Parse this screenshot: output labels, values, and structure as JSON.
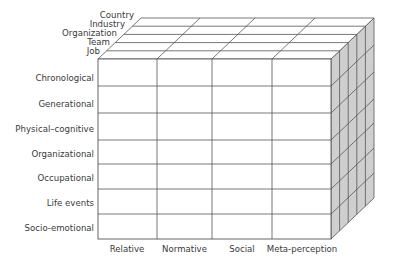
{
  "diagram": {
    "type": "3d-cube-matrix",
    "colors": {
      "front_face": "#ffffff",
      "top_face": "#ffffff",
      "side_face": "#cfcfcf",
      "grid_line": "#555555",
      "text": "#3a3a3a"
    },
    "front_rows": [
      {
        "label": "Chronological"
      },
      {
        "label": "Generational"
      },
      {
        "label": "Physical–cognitive"
      },
      {
        "label": "Organizational"
      },
      {
        "label": "Occupational"
      },
      {
        "label": "Life events"
      },
      {
        "label": "Socio-emotional"
      }
    ],
    "front_columns": [
      {
        "label": "Relative"
      },
      {
        "label": "Normative"
      },
      {
        "label": "Social"
      },
      {
        "label": "Meta-perception"
      }
    ],
    "depth_layers": [
      {
        "label": "Job"
      },
      {
        "label": "Team"
      },
      {
        "label": "Organization"
      },
      {
        "label": "Industry"
      },
      {
        "label": "Country"
      }
    ]
  }
}
